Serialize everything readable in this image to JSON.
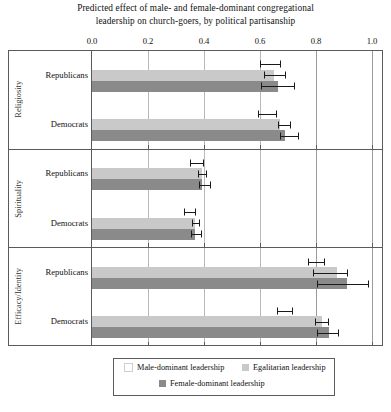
{
  "chart_data": {
    "type": "bar",
    "title": "Predicted effect of male- and female-dominant congregational leadership on church-goers, by political partisanship",
    "title_line1": "Predicted effect of male- and female-dominant congregational",
    "title_line2": "leadership on church-goers, by political partisanship",
    "orientation": "horizontal",
    "xlabel": "",
    "ylabel": "",
    "xlim": [
      0.0,
      1.0
    ],
    "xticks": [
      0.0,
      0.2,
      0.4,
      0.6,
      0.8,
      1.0
    ],
    "xticklabels": [
      "0.0",
      "0.2",
      "0.4",
      "0.6",
      "0.8",
      "1.0"
    ],
    "axis_position": "top",
    "grid": true,
    "legend_position": "bottom",
    "colors": {
      "male_dominant": "#ffffff",
      "egalitarian": "#c9c9c9",
      "female_dominant": "#8a8a8a",
      "error_bar": "#1a1a1a",
      "frame": "#5b5b5b",
      "gridline": "#b8b8b8"
    },
    "series": [
      {
        "name": "Male-dominant leadership",
        "key": "male_dominant"
      },
      {
        "name": "Egalitarian leadership",
        "key": "egalitarian"
      },
      {
        "name": "Female-dominant leadership",
        "key": "female_dominant"
      }
    ],
    "panels": [
      {
        "label": "Religiosity",
        "groups": [
          {
            "label": "Republicans",
            "estimates": [
              {
                "series": "male_dominant",
                "value": 0.635,
                "ci_low": 0.6,
                "ci_high": 0.67
              },
              {
                "series": "egalitarian",
                "value": 0.65,
                "ci_low": 0.615,
                "ci_high": 0.69
              },
              {
                "series": "female_dominant",
                "value": 0.665,
                "ci_low": 0.602,
                "ci_high": 0.72
              }
            ]
          },
          {
            "label": "Democrats",
            "estimates": [
              {
                "series": "male_dominant",
                "value": 0.625,
                "ci_low": 0.593,
                "ci_high": 0.657
              },
              {
                "series": "egalitarian",
                "value": 0.672,
                "ci_low": 0.665,
                "ci_high": 0.707
              },
              {
                "series": "female_dominant",
                "value": 0.69,
                "ci_low": 0.67,
                "ci_high": 0.735
              }
            ]
          }
        ]
      },
      {
        "label": "Spirituality",
        "groups": [
          {
            "label": "Republicans",
            "estimates": [
              {
                "series": "male_dominant",
                "value": 0.372,
                "ci_low": 0.35,
                "ci_high": 0.395
              },
              {
                "series": "egalitarian",
                "value": 0.392,
                "ci_low": 0.378,
                "ci_high": 0.408
              },
              {
                "series": "female_dominant",
                "value": 0.392,
                "ci_low": 0.382,
                "ci_high": 0.42
              }
            ]
          },
          {
            "label": "Democrats",
            "estimates": [
              {
                "series": "male_dominant",
                "value": 0.348,
                "ci_low": 0.33,
                "ci_high": 0.368
              },
              {
                "series": "egalitarian",
                "value": 0.368,
                "ci_low": 0.358,
                "ci_high": 0.383
              },
              {
                "series": "female_dominant",
                "value": 0.368,
                "ci_low": 0.352,
                "ci_high": 0.39
              }
            ]
          }
        ]
      },
      {
        "label": "Efficacy/Identity",
        "groups": [
          {
            "label": "Republicans",
            "estimates": [
              {
                "series": "male_dominant",
                "value": 0.8,
                "ci_low": 0.772,
                "ci_high": 0.828
              },
              {
                "series": "egalitarian",
                "value": 0.875,
                "ci_low": 0.79,
                "ci_high": 0.912
              },
              {
                "series": "female_dominant",
                "value": 0.91,
                "ci_low": 0.805,
                "ci_high": 0.985
              }
            ]
          },
          {
            "label": "Democrats",
            "estimates": [
              {
                "series": "male_dominant",
                "value": 0.688,
                "ci_low": 0.662,
                "ci_high": 0.715
              },
              {
                "series": "egalitarian",
                "value": 0.822,
                "ci_low": 0.797,
                "ci_high": 0.842
              },
              {
                "series": "female_dominant",
                "value": 0.845,
                "ci_low": 0.805,
                "ci_high": 0.878
              }
            ]
          }
        ]
      }
    ]
  },
  "legend": {
    "rows": [
      [
        {
          "label": "Male-dominant leadership",
          "swatch": "male"
        },
        {
          "label": "Egalitarian leadership",
          "swatch": "egal"
        }
      ],
      [
        {
          "label": "Female-dominant leadership",
          "swatch": "female"
        }
      ]
    ]
  }
}
